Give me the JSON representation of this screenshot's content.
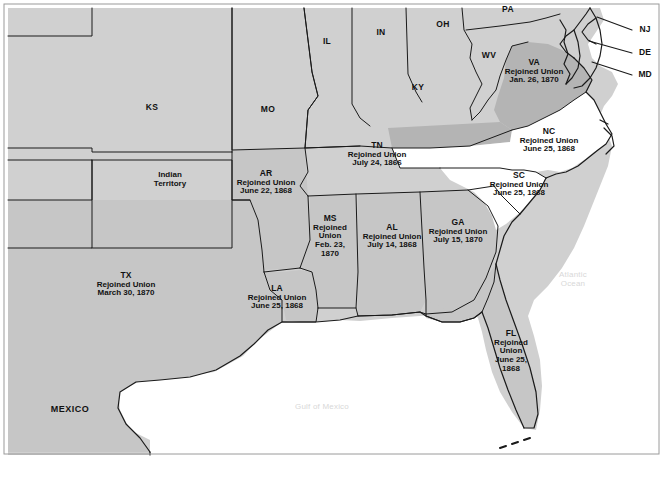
{
  "map": {
    "title": "Reconstruction Era map of the United States showing dates Confederate states rejoined the Union",
    "colors": {
      "land_gray": "#d0d0d0",
      "confederate_gray": "#c6c6c6",
      "virginia_gray": "#b4b4b4",
      "white_state": "#ffffff",
      "water": "#ffffff",
      "border": "#1a1a1a",
      "text": "#111111",
      "ocean_text": "#d8d8d8"
    },
    "rejoined_states": [
      {
        "abbr": "VA",
        "rejoined": "Rejoined Union",
        "date": "Jan. 26, 1870",
        "x": 534,
        "y": 72,
        "shade": "virginia_gray",
        "lines": 3
      },
      {
        "abbr": "NC",
        "rejoined": "Rejoined Union",
        "date": "June 25, 1868",
        "x": 549,
        "y": 141,
        "shade": "white_state",
        "lines": 3
      },
      {
        "abbr": "SC",
        "rejoined": "Rejoined Union",
        "date": "June 25, 1868",
        "x": 519,
        "y": 185,
        "shade": "white_state",
        "lines": 3
      },
      {
        "abbr": "TN",
        "rejoined": "Rejoined Union",
        "date": "July 24, 1866",
        "x": 377,
        "y": 155,
        "shade": "land_gray",
        "lines": 3
      },
      {
        "abbr": "AR",
        "rejoined": "Rejoined Union",
        "date": "June 22, 1868",
        "x": 266,
        "y": 183,
        "shade": "confederate_gray",
        "lines": 3
      },
      {
        "abbr": "MS",
        "rejoined": "Rejoined Union",
        "date": "Feb. 23, 1870",
        "x": 330,
        "y": 237,
        "shade": "confederate_gray",
        "lines": 4
      },
      {
        "abbr": "AL",
        "rejoined": "Rejoined Union",
        "date": "July 14, 1868",
        "x": 392,
        "y": 237,
        "shade": "confederate_gray",
        "lines": 3
      },
      {
        "abbr": "GA",
        "rejoined": "Rejoined Union",
        "date": "July 15, 1870",
        "x": 458,
        "y": 232,
        "shade": "confederate_gray",
        "lines": 3
      },
      {
        "abbr": "LA",
        "rejoined": "Rejoined Union",
        "date": "June 25, 1868",
        "x": 277,
        "y": 298,
        "shade": "confederate_gray",
        "lines": 3
      },
      {
        "abbr": "TX",
        "rejoined": "Rejoined Union",
        "date": "March 30, 1870",
        "x": 126,
        "y": 285,
        "shade": "confederate_gray",
        "lines": 3
      },
      {
        "abbr": "FL",
        "rejoined": "Rejoined Union",
        "date": "June 25, 1868",
        "x": 511,
        "y": 352,
        "shade": "confederate_gray",
        "lines": 4
      }
    ],
    "plain_states": [
      {
        "abbr": "KS",
        "x": 152,
        "y": 108
      },
      {
        "abbr": "MO",
        "x": 268,
        "y": 110
      },
      {
        "abbr": "IL",
        "x": 327,
        "y": 42
      },
      {
        "abbr": "IN",
        "x": 381,
        "y": 33
      },
      {
        "abbr": "OH",
        "x": 443,
        "y": 25
      },
      {
        "abbr": "PA",
        "x": 508,
        "y": 10
      },
      {
        "abbr": "WV",
        "x": 489,
        "y": 56
      },
      {
        "abbr": "KY",
        "x": 418,
        "y": 88
      }
    ],
    "territories": [
      {
        "name": "Indian\nTerritory",
        "x": 170,
        "y": 180
      }
    ],
    "pointer_labels": [
      {
        "abbr": "NJ",
        "x": 645,
        "y": 30,
        "line_from_x": 632,
        "line_from_y": 30,
        "line_to_x": 597,
        "line_to_y": 17
      },
      {
        "abbr": "DE",
        "x": 645,
        "y": 53,
        "line_from_x": 632,
        "line_from_y": 53,
        "line_to_x": 589,
        "line_to_y": 41
      },
      {
        "abbr": "MD",
        "x": 645,
        "y": 75,
        "line_from_x": 632,
        "line_from_y": 75,
        "line_to_x": 592,
        "line_to_y": 62
      }
    ],
    "water_labels": [
      {
        "name": "Atlantic\nOcean",
        "x": 573,
        "y": 280
      },
      {
        "name": "Gulf of Mexico",
        "x": 322,
        "y": 407
      }
    ],
    "country_labels": [
      {
        "name": "MEXICO",
        "x": 70,
        "y": 409
      }
    ]
  }
}
